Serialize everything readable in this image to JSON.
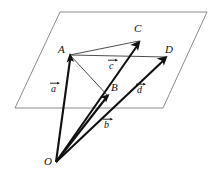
{
  "figure": {
    "type": "vector-geometry-diagram",
    "background_color": "#ffffff",
    "plane_stroke_color": "#8c8c8c",
    "vector_stroke_color": "#111111",
    "connector_stroke_color": "#3a3a3a"
  },
  "points": [
    {
      "id": "O",
      "label": "O",
      "label_x": 44,
      "label_y": 156,
      "x": 56,
      "y": 162
    },
    {
      "id": "A",
      "label": "A",
      "label_x": 58,
      "label_y": 44,
      "x": 70,
      "y": 55
    },
    {
      "id": "B",
      "label": "B",
      "label_x": 111,
      "label_y": 82,
      "x": 108,
      "y": 95
    },
    {
      "id": "C",
      "label": "C",
      "label_x": 134,
      "label_y": 23,
      "x": 140,
      "y": 42
    },
    {
      "id": "D",
      "label": "D",
      "label_x": 165,
      "label_y": 44,
      "x": 167,
      "y": 57
    }
  ],
  "vectors": [
    {
      "id": "a",
      "label": "a",
      "from": "O",
      "to": "A",
      "label_x": 51,
      "label_y": 84
    },
    {
      "id": "b",
      "label": "b",
      "from": "O",
      "to": "B",
      "label_x": 104,
      "label_y": 120
    },
    {
      "id": "c",
      "label": "c",
      "from": "O",
      "to": "C",
      "label_x": 109,
      "label_y": 61
    },
    {
      "id": "d",
      "label": "d",
      "from": "O",
      "to": "D",
      "label_x": 137,
      "label_y": 85
    }
  ],
  "plane": {
    "name": "plane-through-A-B-C-D",
    "corners": [
      {
        "x": 60,
        "y": 12
      },
      {
        "x": 207,
        "y": 12
      },
      {
        "x": 163,
        "y": 108
      },
      {
        "x": 15,
        "y": 108
      }
    ]
  },
  "connectors": [
    {
      "id": "AC",
      "from": "A",
      "to": "C"
    },
    {
      "id": "AD",
      "from": "A",
      "to": "D"
    },
    {
      "id": "AB",
      "from": "A",
      "to": "B"
    }
  ]
}
